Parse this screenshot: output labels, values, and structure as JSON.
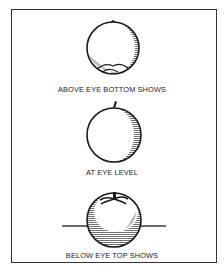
{
  "figure": {
    "panels": [
      {
        "id": "above",
        "caption": "ABOVE EYE BOTTOM SHOWS",
        "view": "bottom-shows"
      },
      {
        "id": "level",
        "caption": "AT EYE LEVEL",
        "view": "eye-level"
      },
      {
        "id": "below",
        "caption": "BELOW EYE TOP SHOWS",
        "view": "top-shows"
      }
    ],
    "colors": {
      "line": "#1a1a1a",
      "background": "#ffffff",
      "frame": "#333333"
    }
  }
}
